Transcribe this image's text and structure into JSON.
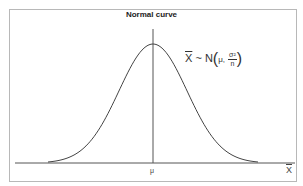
{
  "chart_data": {
    "type": "line",
    "title": "Normal curve",
    "xlabel": "X̄",
    "ylabel": "",
    "x_tick_labels": [
      "μ"
    ],
    "annotation": {
      "lhs": "X",
      "tilde": "~",
      "dist": "N",
      "param_mean": "μ,",
      "param_var_num": "σ²",
      "param_var_den": "n"
    },
    "series": [
      {
        "name": "normal density",
        "x": [
          -3,
          -2.5,
          -2,
          -1.5,
          -1,
          -0.5,
          0,
          0.5,
          1,
          1.5,
          2,
          2.5,
          3
        ],
        "values": [
          0.004,
          0.018,
          0.054,
          0.13,
          0.242,
          0.352,
          0.399,
          0.352,
          0.242,
          0.13,
          0.054,
          0.018,
          0.004
        ]
      }
    ],
    "grid": false,
    "legend": "none",
    "vertical_line_at": "μ"
  }
}
